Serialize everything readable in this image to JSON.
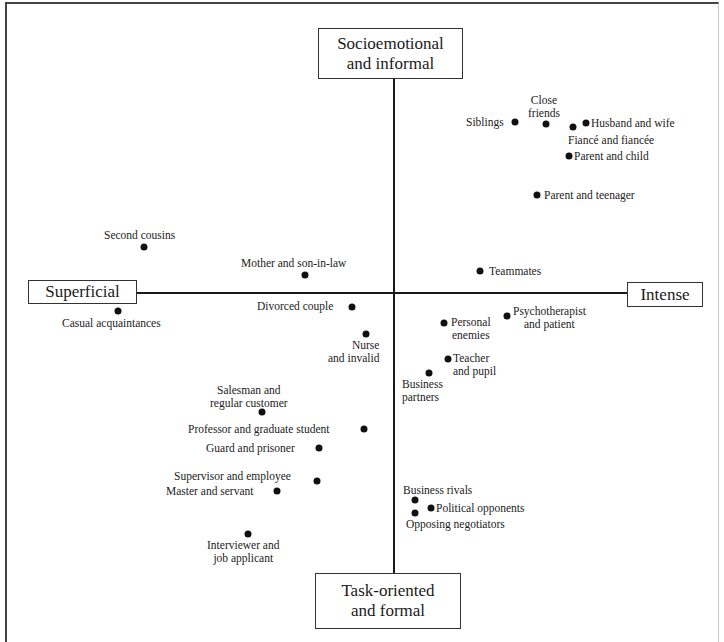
{
  "poles": {
    "top": "Socioemotional\nand informal",
    "bottom": "Task-oriented\nand formal",
    "left": "Superficial",
    "right": "Intense"
  },
  "points": [
    {
      "name": "Siblings",
      "label": "Siblings"
    },
    {
      "name": "Close friends",
      "label": "Close\nfriends"
    },
    {
      "name": "Husband and wife",
      "label": "Husband and wife"
    },
    {
      "name": "Fiancé and fiancée",
      "label": "Fiancé and fiancée"
    },
    {
      "name": "Parent and child",
      "label": "Parent and child"
    },
    {
      "name": "Parent and teenager",
      "label": "Parent and teenager"
    },
    {
      "name": "Second cousins",
      "label": "Second cousins"
    },
    {
      "name": "Mother and son-in-law",
      "label": "Mother and son-in-law"
    },
    {
      "name": "Teammates",
      "label": "Teammates"
    },
    {
      "name": "Casual acquaintances",
      "label": "Casual acquaintances"
    },
    {
      "name": "Divorced couple",
      "label": "Divorced couple"
    },
    {
      "name": "Psychotherapist and patient",
      "label": "Psychotherapist\nand patient"
    },
    {
      "name": "Personal enemies",
      "label": "Personal\nenemies"
    },
    {
      "name": "Nurse and invalid",
      "label": "Nurse\nand invalid"
    },
    {
      "name": "Teacher and pupil",
      "label": "Teacher\nand pupil"
    },
    {
      "name": "Business partners",
      "label": "Business\npartners"
    },
    {
      "name": "Salesman and regular customer",
      "label": "Salesman and\nregular customer"
    },
    {
      "name": "Professor and graduate student",
      "label": "Professor and graduate student"
    },
    {
      "name": "Guard and prisoner",
      "label": "Guard and prisoner"
    },
    {
      "name": "Supervisor and employee",
      "label": "Supervisor and employee"
    },
    {
      "name": "Master and servant",
      "label": "Master and servant"
    },
    {
      "name": "Interviewer and job applicant",
      "label": "Interviewer and\njob applicant"
    },
    {
      "name": "Business rivals",
      "label": "Business rivals"
    },
    {
      "name": "Political opponents",
      "label": "Political opponents"
    },
    {
      "name": "Opposing negotiators",
      "label": "Opposing negotiators"
    }
  ]
}
